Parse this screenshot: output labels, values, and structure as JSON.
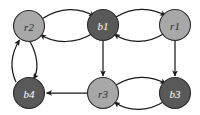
{
  "figure": {
    "kind": "directed-graph",
    "background_color": "#ffffff",
    "edge_color": "#1a1a1a",
    "node_stroke_color": "#2b2b2b",
    "light_node_fill": "#a8a8a8",
    "dark_node_fill": "#595959",
    "light_label_color": "#2e2e2e",
    "dark_label_color": "#ffffff"
  },
  "nodes": [
    {
      "id": "r2",
      "label": "r2",
      "shade": "light",
      "cx": 29,
      "cy": 26,
      "r": 15.5
    },
    {
      "id": "b1",
      "label": "b1",
      "shade": "dark",
      "cx": 103,
      "cy": 25,
      "r": 15.5
    },
    {
      "id": "r1",
      "label": "r1",
      "shade": "light",
      "cx": 175,
      "cy": 25,
      "r": 15.5
    },
    {
      "id": "b4",
      "label": "b4",
      "shade": "dark",
      "cx": 29,
      "cy": 93,
      "r": 15.5
    },
    {
      "id": "r3",
      "label": "r3",
      "shade": "light",
      "cx": 103,
      "cy": 93,
      "r": 15.5
    },
    {
      "id": "b3",
      "label": "b3",
      "shade": "dark",
      "cx": 175,
      "cy": 93,
      "r": 15.5
    }
  ],
  "edges": [
    {
      "id": "r2-to-b1",
      "from": "r2",
      "to": "b1",
      "style": "curved",
      "path": "M 42.5 18.5 C 60 7, 80 7, 94.5 16.5"
    },
    {
      "id": "b1-to-r2",
      "from": "b1",
      "to": "r2",
      "style": "curved",
      "path": "M 92.5 33.5 C 76 44, 54 44, 40.5 34.5"
    },
    {
      "id": "b1-to-r1",
      "from": "b1",
      "to": "r1",
      "style": "curved",
      "path": "M 116 17 C 132 7, 152 7, 165.5 16"
    },
    {
      "id": "r1-to-b1",
      "from": "r1",
      "to": "b1",
      "style": "curved",
      "path": "M 164 33.5 C 148 44, 128 44, 114.5 34"
    },
    {
      "id": "b4-to-r2",
      "from": "b4",
      "to": "r2",
      "style": "curved",
      "path": "M 16 82 C 9 67, 11 54, 19.5 40"
    },
    {
      "id": "r2-to-b4",
      "from": "r2",
      "to": "b4",
      "style": "curved",
      "path": "M 30 41.5 C 38 56, 39 70, 33.5 79"
    },
    {
      "id": "b1-to-r3",
      "from": "b1",
      "to": "r3",
      "style": "straight",
      "path": "M 103 40.5 L 103 76"
    },
    {
      "id": "r1-to-b3",
      "from": "r1",
      "to": "b3",
      "style": "straight",
      "path": "M 175 40.5 L 175 76"
    },
    {
      "id": "r3-to-b4",
      "from": "r3",
      "to": "b4",
      "style": "straight",
      "path": "M 87.5 93 L 46.5 93"
    },
    {
      "id": "r3-to-b3",
      "from": "r3",
      "to": "b3",
      "style": "curved",
      "path": "M 116 85 C 132 75, 152 75, 165.5 84"
    },
    {
      "id": "b3-to-r3",
      "from": "b3",
      "to": "r3",
      "style": "curved",
      "path": "M 164 101.5 C 148 112, 128 112, 114.5 102"
    }
  ]
}
